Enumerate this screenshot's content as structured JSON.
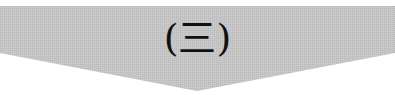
{
  "banner": {
    "label": "(三)",
    "fill_color": "#c4c4c4",
    "text_color": "#111111",
    "shape": "downward-pointing-chevron-banner"
  }
}
